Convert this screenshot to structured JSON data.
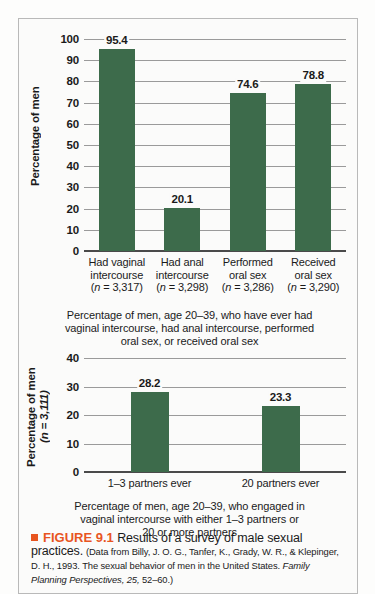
{
  "figure": {
    "marker": "■",
    "label": "FIGURE 9.1",
    "title": "Results of a survey of male sexual practices.",
    "source_prefix": "(Data from Billy, J. O. G., Tanfer, K., Grady, W. R., & Klepinger, D. H., 1993. The sexual behavior of men in the United States. ",
    "source_italic": "Family Planning Perspectives, 25,",
    "source_suffix": " 52–60.)"
  },
  "chart_data": [
    {
      "id": "chart-top",
      "type": "bar",
      "title": "",
      "categories": [
        "Had vaginal\nintercourse\n(n = 3,317)",
        "Had anal\nintercourse\n(n = 3,298)",
        "Performed\noral sex\n(n = 3,286)",
        "Received\noral sex\n(n = 3,290)"
      ],
      "category_lines": [
        [
          "Had vaginal",
          "intercourse",
          "(n = 3,317)"
        ],
        [
          "Had anal",
          "intercourse",
          "(n = 3,298)"
        ],
        [
          "Performed",
          "oral sex",
          "(n = 3,286)"
        ],
        [
          "Received",
          "oral sex",
          "(n = 3,290)"
        ]
      ],
      "values": [
        95.4,
        20.1,
        74.6,
        78.8
      ],
      "value_labels": [
        "95.4",
        "20.1",
        "74.6",
        "78.8"
      ],
      "ylabel": "Percentage of men",
      "xlabel": "Percentage of men, age 20–39, who have ever had vaginal intercourse, had anal intercourse, performed oral sex, or received oral sex",
      "xlabel_lines": [
        "Percentage of men, age 20–39, who have ever had",
        "vaginal intercourse, had anal intercourse, performed",
        "oral sex, or received oral sex"
      ],
      "ylim": [
        0,
        100
      ],
      "yticks": [
        0,
        10,
        20,
        30,
        40,
        50,
        60,
        70,
        80,
        90,
        100
      ],
      "ytick_labels": [
        "0",
        "10",
        "20",
        "30",
        "40",
        "50",
        "60",
        "70",
        "80",
        "90",
        "100"
      ],
      "grid": true,
      "legend": "none",
      "bar_color": "#3d6b4b"
    },
    {
      "id": "chart-bottom",
      "type": "bar",
      "title": "",
      "categories": [
        "1–3 partners ever",
        "20 partners ever"
      ],
      "category_lines": [
        [
          "1–3 partners ever"
        ],
        [
          "20 partners ever"
        ]
      ],
      "values": [
        28.2,
        23.3
      ],
      "value_labels": [
        "28.2",
        "23.3"
      ],
      "ylabel": "Percentage of men",
      "ylabel_sub": "(n = 3,111)",
      "xlabel": "Percentage of men, age 20–39, who engaged in vaginal intercourse with either 1–3 partners or 20 or more partners",
      "xlabel_lines": [
        "Percentage of men, age 20–39, who engaged in",
        "vaginal intercourse with either 1–3 partners or",
        "20 or more partners"
      ],
      "ylim": [
        0,
        40
      ],
      "yticks": [
        0,
        10,
        20,
        30,
        40
      ],
      "ytick_labels": [
        "0",
        "10",
        "20",
        "30",
        "40"
      ],
      "grid": true,
      "legend": "none",
      "bar_color": "#3d6b4b"
    }
  ]
}
